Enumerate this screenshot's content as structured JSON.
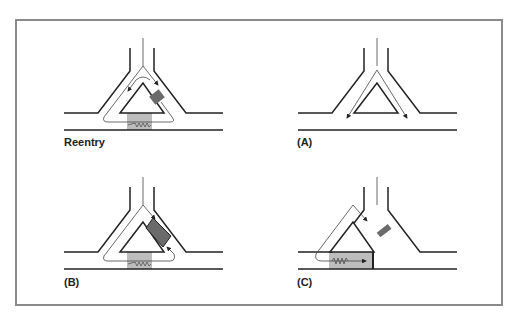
{
  "figure": {
    "frame_color": "#8a8a8a",
    "line_color": "#222222",
    "unidirectional_block_color": "#6b6b6b",
    "slow_conduction_color": "#bdbdbd",
    "panels": [
      {
        "id": "reentry",
        "label": "Reentry",
        "offset": [
          0,
          0
        ],
        "description": "Impulse travels down both limbs; one limb has unidirectional block, impulse conducts slowly through depressed segment and re-enters retrogradely"
      },
      {
        "id": "A",
        "label": "(A)",
        "offset": [
          234,
          0
        ],
        "description": "Normal conduction down both limbs"
      },
      {
        "id": "B",
        "label": "(B)",
        "offset": [
          0,
          139
        ],
        "description": "Bidirectional/large block region prevents reentry"
      },
      {
        "id": "C",
        "label": "(C)",
        "offset": [
          234,
          139
        ],
        "description": "Slow conduction path blocked at end"
      }
    ]
  }
}
